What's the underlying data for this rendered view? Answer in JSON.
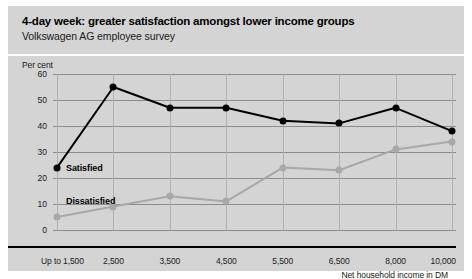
{
  "header": {
    "title": "4-day week: greater satisfaction amongst lower income groups",
    "subtitle": "Volkswagen AG employee survey"
  },
  "chart_data": {
    "type": "line",
    "title": "4-day week: greater satisfaction amongst lower income groups",
    "subtitle": "Volkswagen AG employee survey",
    "unit_label": "Per cent",
    "xlabel": "Net household income in DM",
    "ylabel": "Per cent",
    "categories": [
      "Up to 1,500",
      "2,500",
      "3,500",
      "4,500",
      "5,500",
      "6,500",
      "8,000",
      "10,000"
    ],
    "yticks": [
      60,
      50,
      40,
      30,
      20,
      10,
      0
    ],
    "ylim": [
      0,
      60
    ],
    "grid": true,
    "legend": "inline-labels",
    "series": [
      {
        "name": "Satisfied",
        "color": "#000000",
        "values": [
          24,
          55,
          47,
          47,
          42,
          41,
          47,
          38
        ]
      },
      {
        "name": "Dissatisfied",
        "color": "#a8a8a8",
        "values": [
          5,
          9,
          13,
          11,
          24,
          23,
          31,
          34
        ]
      }
    ]
  }
}
